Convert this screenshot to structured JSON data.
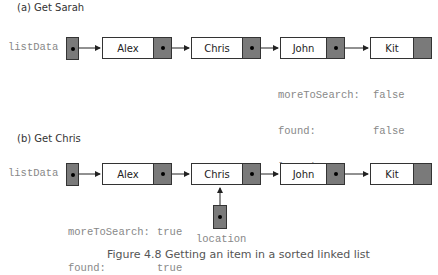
{
  "part_a": {
    "title": "(a) Get Sarah",
    "head_label": "listData",
    "nodes": [
      "Alex",
      "Chris",
      "John",
      "Kit"
    ],
    "vars": {
      "more_label": "moreToSearch:",
      "found_label": "found:",
      "location_label": "location:",
      "more_value": "false",
      "found_value": "false",
      "location_value": "NULL"
    }
  },
  "part_b": {
    "title": "(b) Get Chris",
    "head_label": "listData",
    "nodes": [
      "Alex",
      "Chris",
      "John",
      "Kit"
    ],
    "vars": {
      "more_label": "moreToSearch:",
      "found_label": "found:",
      "more_value": "true",
      "found_value": "true"
    },
    "location_pointer_label": "location"
  },
  "caption": "Figure 4.8   Getting an item in a sorted linked list",
  "colors": {
    "pointer_fill": "#7a7a7a",
    "outline": "#333333",
    "code_text": "#888888"
  }
}
